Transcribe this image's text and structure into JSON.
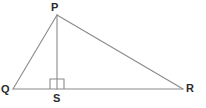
{
  "figure": {
    "kind": "geometry-diagram",
    "background_color": "#ffffff",
    "line_color": "#8a8a8a",
    "label_color": "#2b2b2b",
    "labels": {
      "apex": "P",
      "left_vertex": "Q",
      "right_vertex": "R",
      "foot_of_altitude": "S"
    },
    "points": {
      "P": {
        "x": 57,
        "y": 15
      },
      "Q": {
        "x": 13,
        "y": 89
      },
      "R": {
        "x": 183,
        "y": 89
      },
      "S": {
        "x": 57,
        "y": 89
      }
    },
    "segments": [
      {
        "name": "QP",
        "from": "Q",
        "to": "P"
      },
      {
        "name": "PR",
        "from": "P",
        "to": "R"
      },
      {
        "name": "QR",
        "from": "Q",
        "to": "R"
      },
      {
        "name": "PS",
        "from": "P",
        "to": "S"
      }
    ],
    "right_angle_marker": {
      "at": "S",
      "x": 50,
      "y": 79,
      "width": 14,
      "height": 10
    }
  }
}
